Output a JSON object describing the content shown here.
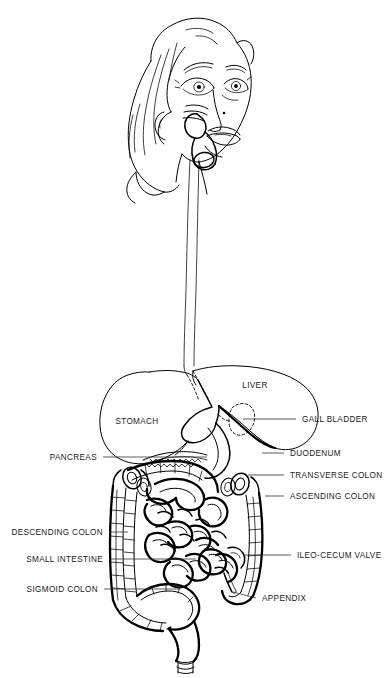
{
  "figure": {
    "background_color": "#ffffff",
    "ink_color": "#000000",
    "label_color": "#1a1a1a",
    "style": "black-and-white line art",
    "width": 390,
    "height": 678
  },
  "inline_labels": [
    {
      "id": "liver",
      "text": "LIVER",
      "x": 255,
      "y": 388,
      "align": "middle"
    },
    {
      "id": "stomach",
      "text": "STOMACH",
      "x": 137,
      "y": 424,
      "align": "middle"
    }
  ],
  "callouts": [
    {
      "id": "gall-bladder",
      "text": "GALL BLADDER",
      "side": "right",
      "text_x": 302,
      "text_y": 422,
      "leader": "M 296 419 L 243 419"
    },
    {
      "id": "duodenum",
      "text": "DUODENUM",
      "side": "right",
      "text_x": 290,
      "text_y": 456,
      "leader": "M 284 453 L 262 453"
    },
    {
      "id": "transverse-colon",
      "text": "TRANSVERSE COLON",
      "side": "right",
      "text_x": 290,
      "text_y": 478,
      "leader": "M 284 475 L 248 475"
    },
    {
      "id": "ascending-colon",
      "text": "ASCENDING COLON",
      "side": "right",
      "text_x": 290,
      "text_y": 499,
      "leader": "M 284 496 L 265 496"
    },
    {
      "id": "ileo-cecum-valve",
      "text": "ILEO-CECUM VALVE",
      "side": "right",
      "text_x": 297,
      "text_y": 558,
      "leader": "M 291 555 L 243 555"
    },
    {
      "id": "appendix",
      "text": "APPENDIX",
      "side": "right",
      "text_x": 262,
      "text_y": 601,
      "leader": "M 256 598 L 233 592"
    },
    {
      "id": "pancreas",
      "text": "PANCREAS",
      "side": "left",
      "text_x": 97,
      "text_y": 460,
      "leader": "M 103 457 L 207 457"
    },
    {
      "id": "descending-colon",
      "text": "DESCENDING COLON",
      "side": "left",
      "text_x": 103,
      "text_y": 535,
      "leader": "M 109 532 L 128 532"
    },
    {
      "id": "small-intestine",
      "text": "SMALL INTESTINE",
      "side": "left",
      "text_x": 103,
      "text_y": 562,
      "leader": "M 109 559 L 196 559"
    },
    {
      "id": "sigmoid-colon",
      "text": "SIGMOID COLON",
      "side": "left",
      "text_x": 98,
      "text_y": 592,
      "leader": "M 104 589 L 180 589"
    }
  ]
}
